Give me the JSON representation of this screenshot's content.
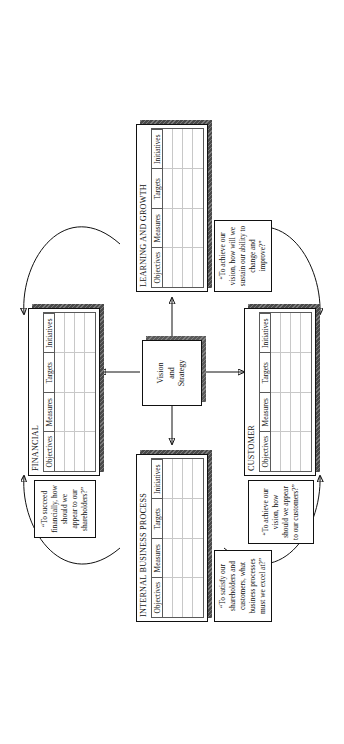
{
  "diagram": {
    "center": {
      "line1": "Vision",
      "line2": "and",
      "line3": "Strategy"
    },
    "columns": [
      "Objectives",
      "Measures",
      "Targets",
      "Initiatives"
    ],
    "perspectives": [
      {
        "id": "financial",
        "label": "FINANCIAL",
        "quote": "“To succeed financially, how should we appear to our shareholders?”"
      },
      {
        "id": "customer",
        "label": "CUSTOMER",
        "quote": "“To achieve our vision, how should we appear to our customers?”"
      },
      {
        "id": "internal-business-process",
        "label": "INTERNAL BUSINESS PROCESS",
        "quote": "“To satisfy our shareholders and customers, what business processes must we excel at?”"
      },
      {
        "id": "learning-and-growth",
        "label": "LEARNING AND GROWTH",
        "quote": "“To achieve our vision, how will we sustain our ability to change and improve?”"
      }
    ],
    "colors": {
      "ink": "#111111",
      "shadow": "#4a4a4a",
      "gridline": "#c8c8c8",
      "background": "#ffffff"
    }
  }
}
